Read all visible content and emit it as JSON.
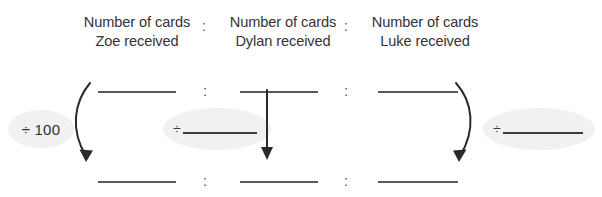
{
  "headers": [
    {
      "line1": "Number of cards",
      "line2": "Zoe received"
    },
    {
      "line1": "Number of cards",
      "line2": "Dylan received"
    },
    {
      "line1": "Number of cards",
      "line2": "Luke received"
    }
  ],
  "header_separators": [
    ":",
    ":"
  ],
  "ratio": {
    "top_row": {
      "blanks": [
        "",
        "",
        ""
      ],
      "separators": [
        ":",
        ":"
      ]
    },
    "bottom_row": {
      "blanks": [
        "",
        "",
        ""
      ],
      "separators": [
        ":",
        ":"
      ]
    }
  },
  "operations": [
    {
      "id": "div-100",
      "label": "÷ 100",
      "symbol": "÷",
      "value": "100",
      "has_blank": false
    },
    {
      "id": "div-blank-middle",
      "label": "÷",
      "symbol": "÷",
      "value": "",
      "has_blank": true
    },
    {
      "id": "div-blank-right",
      "label": "÷",
      "symbol": "÷",
      "value": "",
      "has_blank": true
    }
  ],
  "arrows": [
    {
      "id": "arrow-zoe",
      "shape": "curved-left",
      "direction": "down"
    },
    {
      "id": "arrow-dylan",
      "shape": "straight",
      "direction": "down"
    },
    {
      "id": "arrow-luke",
      "shape": "curved-right",
      "direction": "down"
    }
  ],
  "colors": {
    "text": "#333333",
    "line": "#555b5e",
    "oval_fill": "#f1f1f1",
    "arrow": "#2a2a2a",
    "background": "#ffffff"
  }
}
